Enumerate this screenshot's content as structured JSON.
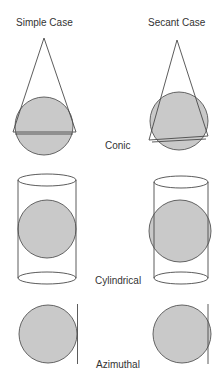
{
  "headers": {
    "simple": "Simple Case",
    "secant": "Secant Case"
  },
  "rows": [
    {
      "id": "conic",
      "label": "Conic"
    },
    {
      "id": "cylindrical",
      "label": "Cylindrical"
    },
    {
      "id": "azimuthal",
      "label": "Azimuthal"
    }
  ],
  "colors": {
    "globe_fill": "#c9c9c9",
    "outline": "#4a4a4a",
    "text": "#333333"
  }
}
